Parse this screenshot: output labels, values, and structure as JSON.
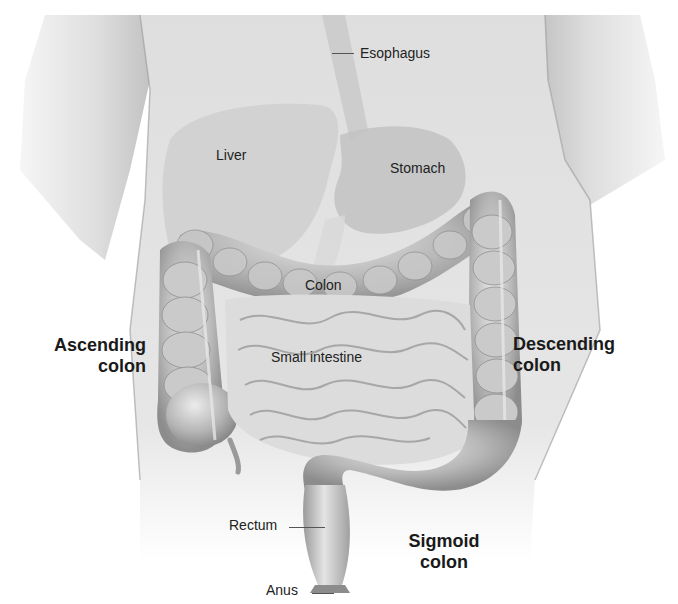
{
  "diagram": {
    "style": "grayscale pencil illustration",
    "colors": {
      "background": "#ffffff",
      "skin": "#d9d9d9",
      "organ": "#b5b5b5",
      "intestine": "#a8a8a8",
      "label_text": "#222222"
    },
    "labels": {
      "esophagus": "Esophagus",
      "liver": "Liver",
      "stomach": "Stomach",
      "colon": "Colon",
      "small_intestine": "Small intestine",
      "ascending_colon_1": "Ascending",
      "ascending_colon_2": "colon",
      "descending_colon_1": "Descending",
      "descending_colon_2": "colon",
      "rectum": "Rectum",
      "sigmoid_colon_1": "Sigmoid",
      "sigmoid_colon_2": "colon",
      "anus": "Anus"
    }
  }
}
